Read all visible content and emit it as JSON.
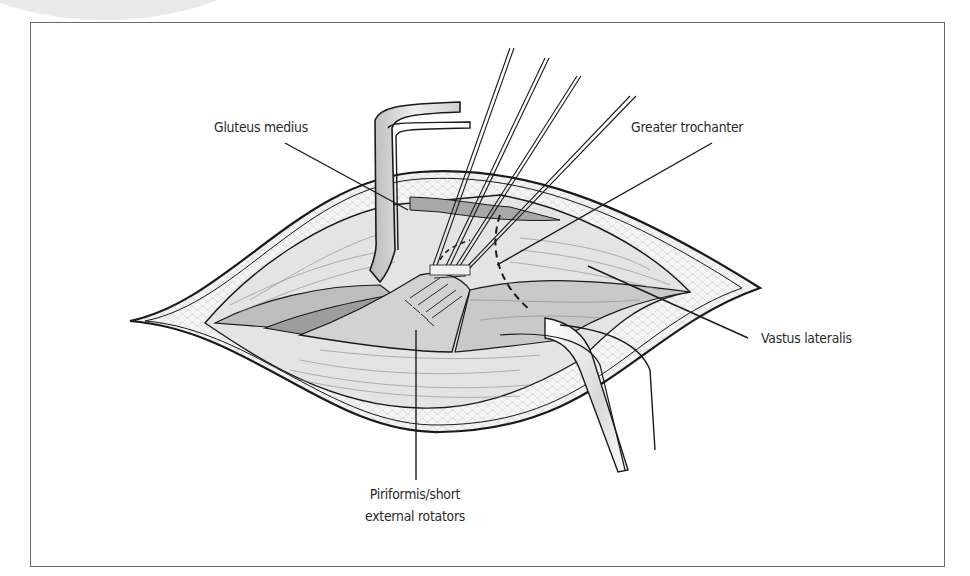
{
  "figure": {
    "type": "surgical illustration",
    "labels": {
      "gluteus_medius": "Gluteus medius",
      "greater_trochanter": "Greater trochanter",
      "vastus_lateralis": "Vastus lateralis",
      "piriformis_line1": "Piriformis/short",
      "piriformis_line2": "external rotators"
    }
  },
  "colors": {
    "outline": "#1a1a1a",
    "muscle_light": "#e6e6e6",
    "muscle_mid": "#c4c4c4",
    "muscle_dark": "#9a9a9a",
    "fat": "#f3f3f3",
    "frame": "#6a6a6a"
  }
}
